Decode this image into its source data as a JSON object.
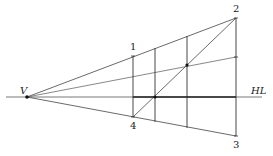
{
  "diagram": {
    "labels": {
      "vanishing_point": "V",
      "horizon_line": "HL",
      "corner_1": "1",
      "corner_2": "2",
      "corner_3": "3",
      "corner_4": "4"
    },
    "colors": {
      "line": "#333333",
      "background": "#ffffff"
    },
    "points": {
      "V": [
        27,
        97
      ],
      "p1": [
        133,
        56
      ],
      "p2": [
        236,
        18
      ],
      "p3": [
        236,
        136
      ],
      "p4": [
        133,
        117
      ],
      "mid_right": [
        236,
        57
      ],
      "dot_a": [
        155,
        97
      ],
      "dot_b": [
        187,
        65
      ]
    },
    "vertical_lines_x": [
      133,
      155,
      187,
      236
    ]
  }
}
